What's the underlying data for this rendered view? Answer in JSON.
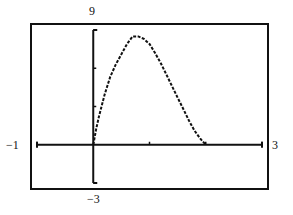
{
  "chart_data": {
    "type": "line",
    "title": "",
    "xlabel": "",
    "ylabel": "",
    "xlim": [
      -1,
      3
    ],
    "ylim": [
      -3,
      9
    ],
    "xscale_ticks": 1,
    "yscale_ticks": 3,
    "grid": false,
    "window_labels": {
      "xmin": "−1",
      "xmax": "3",
      "ymin": "−3",
      "ymax": "9"
    },
    "series": [
      {
        "name": "f(x)",
        "x": [
          0,
          0.05,
          0.1,
          0.2,
          0.3,
          0.4,
          0.5,
          0.6,
          0.7,
          0.8,
          0.9,
          1.0,
          1.1,
          1.2,
          1.3,
          1.4,
          1.5,
          1.6,
          1.7,
          1.8,
          1.9,
          2.0
        ],
        "y": [
          0.0,
          1.2,
          2.2,
          3.9,
          5.3,
          6.3,
          7.1,
          7.9,
          8.5,
          8.5,
          8.3,
          7.9,
          7.2,
          6.4,
          5.5,
          4.6,
          3.7,
          2.8,
          1.9,
          1.1,
          0.5,
          0.0
        ]
      }
    ]
  }
}
